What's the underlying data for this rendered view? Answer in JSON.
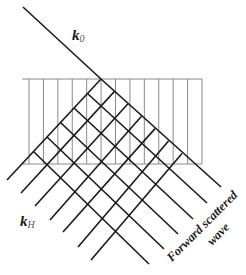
{
  "diagram": {
    "labels": {
      "incident_wavevector": {
        "main": "k",
        "sub": "0"
      },
      "diffracted_wavevector": {
        "main": "k",
        "sub": "H"
      },
      "forward_caption_line1": "Forward scattered",
      "forward_caption_line2": "wave"
    },
    "colors": {
      "beam_lines": "#1a1a1a",
      "crystal_planes": "#8a8a8a",
      "background": "#ffffff"
    },
    "crystal_slab": {
      "x_left": 22,
      "x_right": 202,
      "y_top": 79,
      "y_bottom": 164,
      "plane_count": 13
    },
    "incident_beam": {
      "from": [
        23,
        7
      ],
      "to": [
        101,
        79
      ]
    },
    "forward_lines": [
      {
        "from": [
          101,
          79
        ],
        "to": [
          221,
          187
        ]
      },
      {
        "from": [
          87.5,
          93.5
        ],
        "to": [
          207,
          203
        ]
      },
      {
        "from": [
          74,
          108
        ],
        "to": [
          193,
          219
        ]
      },
      {
        "from": [
          60.5,
          122.5
        ],
        "to": [
          178,
          234
        ]
      },
      {
        "from": [
          47,
          137
        ],
        "to": [
          164,
          249
        ]
      },
      {
        "from": [
          33.5,
          151.5
        ],
        "to": [
          149,
          264
        ]
      }
    ],
    "diffracted_lines": [
      {
        "from": [
          101,
          79
        ],
        "to": [
          7,
          180
        ]
      },
      {
        "from": [
          114.5,
          91.4
        ],
        "to": [
          21,
          193
        ]
      },
      {
        "from": [
          128,
          103.8
        ],
        "to": [
          35,
          206
        ]
      },
      {
        "from": [
          141.5,
          116.2
        ],
        "to": [
          50,
          220
        ]
      },
      {
        "from": [
          155,
          128.6
        ],
        "to": [
          63,
          232
        ]
      },
      {
        "from": [
          168.5,
          141
        ],
        "to": [
          78,
          247
        ]
      },
      {
        "from": [
          182,
          153.4
        ],
        "to": [
          91,
          260
        ]
      }
    ]
  }
}
